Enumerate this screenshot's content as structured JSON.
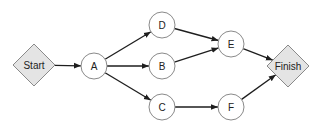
{
  "diagram": {
    "type": "network-flow",
    "colors": {
      "diamond_fill": "#e4e4e4",
      "circle_fill": "#ffffff",
      "node_stroke": "#8a8a8a",
      "edge": "#1e1e1e",
      "text": "#222222"
    },
    "nodes": [
      {
        "id": "start",
        "label": "Start",
        "shape": "diamond"
      },
      {
        "id": "A",
        "label": "A",
        "shape": "circle"
      },
      {
        "id": "D",
        "label": "D",
        "shape": "circle"
      },
      {
        "id": "B",
        "label": "B",
        "shape": "circle"
      },
      {
        "id": "C",
        "label": "C",
        "shape": "circle"
      },
      {
        "id": "E",
        "label": "E",
        "shape": "circle"
      },
      {
        "id": "F",
        "label": "F",
        "shape": "circle"
      },
      {
        "id": "finish",
        "label": "Finish",
        "shape": "diamond"
      }
    ],
    "edges": [
      {
        "from": "start",
        "to": "A"
      },
      {
        "from": "A",
        "to": "D"
      },
      {
        "from": "A",
        "to": "B"
      },
      {
        "from": "A",
        "to": "C"
      },
      {
        "from": "D",
        "to": "E"
      },
      {
        "from": "B",
        "to": "E"
      },
      {
        "from": "C",
        "to": "F"
      },
      {
        "from": "E",
        "to": "finish"
      },
      {
        "from": "F",
        "to": "finish"
      }
    ]
  }
}
